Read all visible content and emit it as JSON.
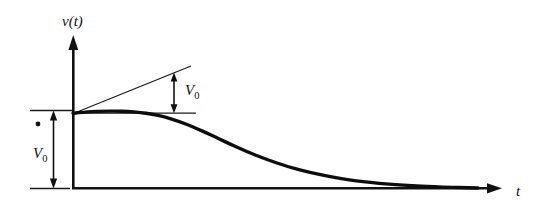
{
  "figure": {
    "background_color": "#ffffff",
    "ink_color": "#111111",
    "width": 542,
    "height": 212
  },
  "axes": {
    "y_axis_label": "v(t)",
    "x_axis_label": "t",
    "y_axis_name": "vertical-axis",
    "x_axis_name": "horizontal-axis",
    "origin_x": 73,
    "origin_y": 188,
    "y_axis_top": 36,
    "x_axis_right": 500
  },
  "annotations": {
    "initial_value_label": "V",
    "initial_value_subscript": "0",
    "slope_label": "V",
    "slope_subscript": "0",
    "initial_value_name": "initial-value-dimension",
    "slope_name": "initial-slope-dimension"
  },
  "chart_data": {
    "type": "line",
    "title": "",
    "xlabel": "t",
    "ylabel": "v(t)",
    "grid": false,
    "legend": false,
    "xlim": [
      0,
      1
    ],
    "ylim": [
      0,
      1
    ],
    "series": [
      {
        "name": "v(t)",
        "x": [
          0.0,
          0.03,
          0.06,
          0.09,
          0.12,
          0.15,
          0.18,
          0.21,
          0.24,
          0.28,
          0.32,
          0.36,
          0.4,
          0.45,
          0.5,
          0.56,
          0.62,
          0.7,
          0.78,
          0.86,
          0.94,
          1.0
        ],
        "y": [
          0.962,
          0.976,
          0.985,
          0.989,
          0.988,
          0.979,
          0.962,
          0.934,
          0.893,
          0.82,
          0.731,
          0.634,
          0.537,
          0.424,
          0.328,
          0.233,
          0.162,
          0.092,
          0.05,
          0.024,
          0.008,
          0.0
        ]
      }
    ],
    "annotations": [
      {
        "name": "initial-slope-tangent",
        "type": "tangent-line",
        "label": "V0",
        "from": [
          0.0,
          0.962
        ],
        "to": [
          0.318,
          1.39
        ],
        "note": "Tangent to curve at t=0; vertical gap between tangent and horizontal level equals V0"
      },
      {
        "name": "initial-level-reference",
        "type": "horizontal-reference",
        "label": "",
        "from": [
          0.0,
          0.962
        ],
        "to": [
          0.33,
          0.962
        ]
      },
      {
        "name": "initial-slope-dimension",
        "type": "double-arrow-vertical",
        "label": "V0",
        "at_x": 0.266,
        "from_y": 0.962,
        "to_y": 1.315
      },
      {
        "name": "initial-value-dimension",
        "type": "double-arrow-vertical",
        "label": "V0",
        "at_x": -0.085,
        "from_y": 0.0,
        "to_y": 0.962
      }
    ]
  }
}
